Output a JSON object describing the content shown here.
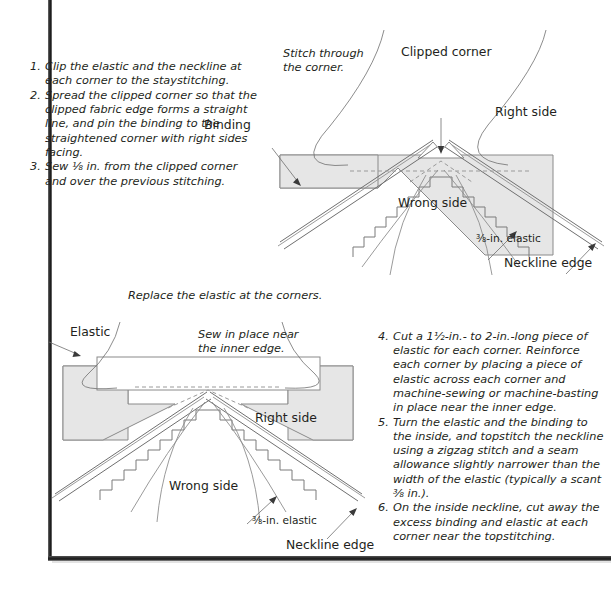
{
  "page": {
    "frame_color": "#1f1f1f",
    "fabric_fill": "#e6e6e6",
    "line_color": "#6f6f6f"
  },
  "steps_top": [
    {
      "num": "1.",
      "text": "Clip the elastic and the neckline at each corner to the staystitching."
    },
    {
      "num": "2.",
      "text": "Spread the clipped corner so that the clipped fabric edge forms a straight line, and pin the binding to the straightened corner with right sides facing."
    },
    {
      "num": "3.",
      "text": "Sew ⅛ in. from the clipped corner and over the previous stitching."
    }
  ],
  "steps_bottom": [
    {
      "num": "4.",
      "text": "Cut a 1½-in.- to 2-in.-long piece of elastic for each corner. Reinforce each corner by placing a piece of elastic across each corner and machine-sewing or machine-basting in place near the inner edge."
    },
    {
      "num": "5.",
      "text": "Turn the elastic and the binding to the inside, and topstitch the neckline using a zigzag stitch and a seam allowance slightly narrower than the width of the elastic (typically a scant ⅜ in.)."
    },
    {
      "num": "6.",
      "text": "On the inside neckline, cut away the excess binding and elastic at each corner near the topstitching."
    }
  ],
  "diagram_top": {
    "caption_stitch": "Stitch through\nthe corner.",
    "label_clipped_corner": "Clipped corner",
    "label_binding": "Binding",
    "label_right_side": "Right side",
    "label_wrong_side": "Wrong side",
    "label_elastic": "⅜-in. elastic",
    "label_neckline_edge": "Neckline edge"
  },
  "diagram_bottom": {
    "caption_replace": "Replace the elastic at the corners.",
    "caption_sew": "Sew in place near\nthe inner edge.",
    "label_elastic_top": "Elastic",
    "label_right_side": "Right side",
    "label_wrong_side": "Wrong side",
    "label_elastic": "⅜-in. elastic",
    "label_neckline_edge": "Neckline edge"
  }
}
